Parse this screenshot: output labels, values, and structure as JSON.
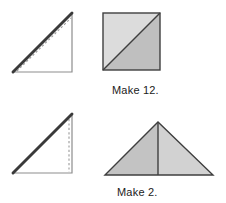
{
  "diagram": {
    "background_color": "#ffffff",
    "ink_color": "#1b1b1b",
    "rows": [
      {
        "id": "row-1",
        "caption": "Make 12.",
        "fold_step": {
          "name": "folded-right-triangle-step-1",
          "description": "Right triangle with thick pressed hypotenuse and dashed stitch line",
          "right_angle_corner": "bottom-right",
          "thick_edge": "hypotenuse",
          "dashed_line": "diagonal-parallel-to-hypotenuse",
          "dashed_color": "#9a9a9a",
          "outline_color": "#8d8d8d",
          "thick_edge_color": "#3a3a3a"
        },
        "result_unit": {
          "name": "half-square-triangle-square",
          "shape": "square",
          "divider": "diagonal-bottom-left-to-top-right",
          "pieces": [
            {
              "name": "upper-left-triangle",
              "fill": "#dcdcdc"
            },
            {
              "name": "lower-right-triangle",
              "fill": "#bfbfbf"
            }
          ],
          "outline_color": "#3f3f3f"
        }
      },
      {
        "id": "row-2",
        "caption": "Make 2.",
        "fold_step": {
          "name": "folded-right-triangle-step-2",
          "description": "Right triangle with thick pressed hypotenuse and vertical dashed line",
          "right_angle_corner": "bottom-right",
          "thick_edge": "hypotenuse",
          "dashed_line": "vertical-right-edge",
          "dashed_color": "#9a9a9a",
          "outline_color": "#8d8d8d",
          "thick_edge_color": "#3a3a3a"
        },
        "result_unit": {
          "name": "flying-geese-triangle",
          "shape": "isosceles-triangle",
          "divider": "vertical-center-line",
          "pieces": [
            {
              "name": "left-half-triangle",
              "fill": "#c3c3c3"
            },
            {
              "name": "right-half-triangle",
              "fill": "#d2d2d2"
            }
          ],
          "outline_color": "#3f3f3f"
        }
      }
    ]
  }
}
